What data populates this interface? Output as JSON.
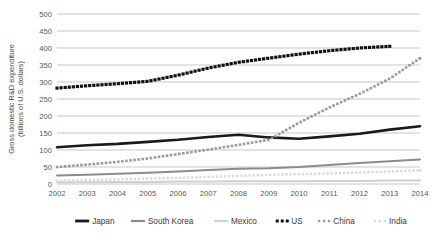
{
  "chart_data": {
    "type": "line",
    "title": "",
    "xlabel": "",
    "ylabel": "Gross domestic R&D expenditure (billions of U.S. dollars)",
    "ylabel_line1": "Gross domestic R&D expenditure",
    "ylabel_line2": "(billions of U.S. dollars)",
    "categories": [
      2002,
      2003,
      2004,
      2005,
      2006,
      2007,
      2008,
      2009,
      2010,
      2011,
      2012,
      2013,
      2014
    ],
    "x_tick_labels": [
      "2002",
      "2003",
      "2004",
      "2005",
      "2006",
      "2007",
      "2008",
      "2009",
      "2010",
      "2011",
      "2012",
      "2013",
      "2014"
    ],
    "y_tick_labels": [
      "0",
      "50",
      "100",
      "150",
      "200",
      "250",
      "300",
      "350",
      "400",
      "450",
      "500"
    ],
    "y_ticks": [
      0,
      50,
      100,
      150,
      200,
      250,
      300,
      350,
      400,
      450,
      500
    ],
    "ylim": [
      0,
      500
    ],
    "xlim": [
      2002,
      2014
    ],
    "grid": true,
    "grid_axis": "y",
    "legend_position": "bottom",
    "series": [
      {
        "name": "Japan",
        "style": "solid",
        "color": "#1a1a1a",
        "width": 2.6,
        "values": [
          108,
          114,
          118,
          124,
          130,
          138,
          145,
          137,
          133,
          140,
          148,
          160,
          170
        ]
      },
      {
        "name": "South Korea",
        "style": "solid",
        "color": "#8c8c8c",
        "width": 2.0,
        "values": [
          25,
          27,
          30,
          33,
          37,
          41,
          45,
          46,
          50,
          56,
          62,
          67,
          72
        ]
      },
      {
        "name": "Mexico",
        "style": "solid",
        "color": "#cfcfcf",
        "width": 2.0,
        "values": [
          5,
          5,
          6,
          6,
          7,
          7,
          8,
          8,
          8,
          9,
          9,
          10,
          10
        ]
      },
      {
        "name": "US",
        "style": "dotted",
        "color": "#111111",
        "width": 3.2,
        "values": [
          282,
          289,
          295,
          302,
          320,
          341,
          358,
          370,
          382,
          392,
          400,
          405,
          null
        ]
      },
      {
        "name": "China",
        "style": "dotted",
        "color": "#9a9a9a",
        "width": 2.6,
        "values": [
          50,
          57,
          65,
          75,
          88,
          101,
          115,
          130,
          180,
          225,
          265,
          310,
          370
        ]
      },
      {
        "name": "India",
        "style": "dotted",
        "color": "#dadada",
        "width": 2.4,
        "values": [
          10,
          12,
          14,
          16,
          18,
          21,
          24,
          27,
          29,
          31,
          34,
          37,
          40
        ]
      }
    ]
  },
  "legend": {
    "items": [
      {
        "label": "Japan",
        "marker": "line",
        "color": "#1a1a1a"
      },
      {
        "label": "South Korea",
        "marker": "line",
        "color": "#8c8c8c"
      },
      {
        "label": "Mexico",
        "marker": "line",
        "color": "#cfcfcf"
      },
      {
        "label": "US",
        "marker": "dots",
        "color": "#111111"
      },
      {
        "label": "China",
        "marker": "dots",
        "color": "#9a9a9a"
      },
      {
        "label": "India",
        "marker": "dots",
        "color": "#dadada"
      }
    ]
  },
  "colors": {
    "background": "#ffffff",
    "gridline": "#b0b0b0",
    "text": "#3a3a3a"
  }
}
